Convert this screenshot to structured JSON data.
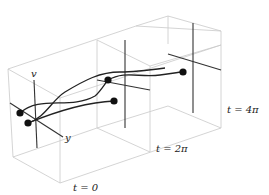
{
  "diagram": {
    "axes": {
      "v_label": "v",
      "y_label": "y"
    },
    "slices": [
      {
        "label": "t = 0"
      },
      {
        "label": "t = 2π"
      },
      {
        "label": "t = 4π"
      }
    ],
    "colors": {
      "box_edge": "#c8c8c8",
      "axis": "#333333",
      "curve": "#222222",
      "dot": "#111111"
    }
  }
}
